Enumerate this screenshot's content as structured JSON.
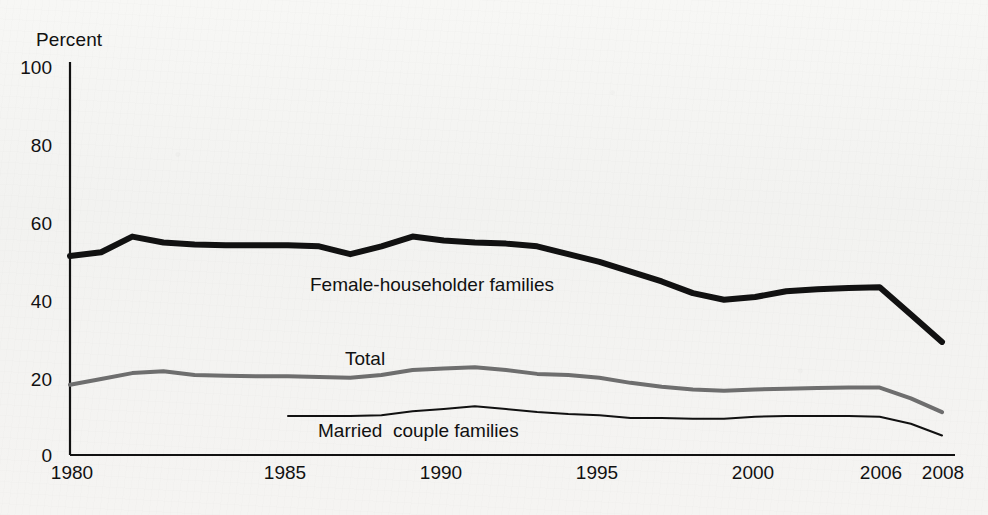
{
  "chart_data": {
    "type": "line",
    "title": "",
    "subtitle": "",
    "xlabel": "",
    "ylabel": "Percent",
    "ylim": [
      0,
      100
    ],
    "xlim": [
      1980,
      2008
    ],
    "yticks": [
      0,
      20,
      40,
      60,
      80,
      100
    ],
    "xticks": [
      1980,
      1985,
      1990,
      1995,
      2000,
      2006,
      2008
    ],
    "grid": false,
    "legend_position": "inline-annotations",
    "series": [
      {
        "name": "Female-householder families",
        "color": "#111111",
        "linewidth": 6,
        "x": [
          1980,
          1981,
          1982,
          1983,
          1984,
          1985,
          1986,
          1987,
          1988,
          1989,
          1990,
          1991,
          1992,
          1993,
          1994,
          1995,
          1996,
          1997,
          1998,
          1999,
          2000,
          2001,
          2002,
          2003,
          2004,
          2005,
          2006,
          2007,
          2008
        ],
        "values": [
          51,
          52,
          56,
          54.5,
          54,
          53.8,
          53.8,
          53.8,
          53.5,
          51.5,
          53.5,
          56,
          55,
          54.5,
          54.2,
          53.5,
          51.5,
          49.5,
          47,
          44.5,
          41.5,
          39.8,
          40.5,
          42,
          42.5,
          42.8,
          43,
          36,
          29
        ]
      },
      {
        "name": "Total",
        "color": "#6e6e6e",
        "linewidth": 4,
        "x": [
          1980,
          1981,
          1982,
          1983,
          1984,
          1985,
          1986,
          1987,
          1988,
          1989,
          1990,
          1991,
          1992,
          1993,
          1994,
          1995,
          1996,
          1997,
          1998,
          1999,
          2000,
          2001,
          2002,
          2003,
          2004,
          2005,
          2006,
          2007,
          2008
        ],
        "values": [
          18,
          19.5,
          21,
          21.5,
          20.5,
          20.3,
          20.2,
          20.2,
          20,
          19.8,
          20.5,
          21.8,
          22.2,
          22.5,
          21.8,
          20.8,
          20.5,
          19.8,
          18.5,
          17.5,
          16.8,
          16.5,
          16.8,
          17,
          17.2,
          17.3,
          17.3,
          14.5,
          11
        ]
      },
      {
        "name": "Married  couple families",
        "color": "#111111",
        "linewidth": 2,
        "x": [
          1987,
          1988,
          1989,
          1990,
          1991,
          1992,
          1993,
          1994,
          1995,
          1996,
          1997,
          1998,
          1999,
          2000,
          2001,
          2002,
          2003,
          2004,
          2005,
          2006,
          2007,
          2008
        ],
        "values": [
          10,
          10,
          10,
          10.2,
          11.2,
          11.8,
          12.5,
          11.8,
          11,
          10.5,
          10.2,
          9.5,
          9.5,
          9.3,
          9.3,
          9.8,
          10,
          10,
          10,
          9.8,
          8,
          5
        ]
      }
    ],
    "annotations": [
      {
        "text": "Female-householder families",
        "x_px": 310,
        "y_px": 274
      },
      {
        "text": "Total",
        "x_px": 345,
        "y_px": 348
      },
      {
        "text": "Married  couple families",
        "x_px": 318,
        "y_px": 420
      }
    ]
  },
  "axes": {
    "y_axis_title": "Percent",
    "y_tick_labels": [
      "100",
      "80",
      "60",
      "40",
      "20",
      "0"
    ],
    "x_tick_labels": [
      "1980",
      "1985",
      "1990",
      "1995",
      "2000",
      "2006",
      "2008"
    ]
  }
}
